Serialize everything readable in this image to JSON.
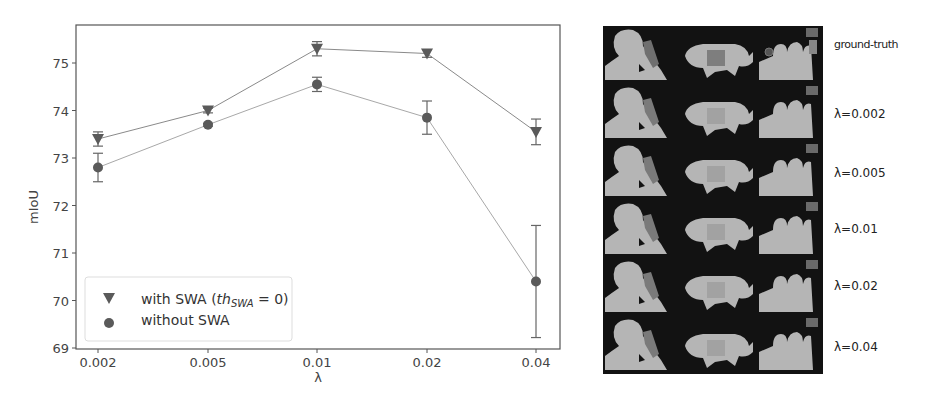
{
  "chart_data": {
    "type": "line",
    "title": "",
    "xlabel": "λ",
    "ylabel": "mIoU",
    "categories": [
      "0.002",
      "0.005",
      "0.01",
      "0.02",
      "0.04"
    ],
    "ylim": [
      69,
      75.8
    ],
    "yticks": [
      69,
      70,
      71,
      72,
      73,
      74,
      75
    ],
    "grid": false,
    "legend_position": "lower left",
    "series": [
      {
        "name": "with SWA (th_SWA = 0)",
        "marker": "triangle-down",
        "color": "#555555",
        "values": [
          73.4,
          74.0,
          75.3,
          75.2,
          73.55
        ],
        "errors": [
          0.15,
          0.05,
          0.15,
          0.08,
          0.27
        ]
      },
      {
        "name": "without SWA",
        "marker": "circle",
        "color": "#555555",
        "values": [
          72.8,
          73.7,
          74.55,
          73.85,
          70.4
        ],
        "errors": [
          0.3,
          0.03,
          0.15,
          0.35,
          1.18
        ]
      }
    ]
  },
  "legend": {
    "items": [
      {
        "prefix": "with SWA (",
        "italic": "th",
        "sub": "SWA",
        "suffix": " = 0)"
      },
      {
        "prefix": "without SWA",
        "italic": "",
        "sub": "",
        "suffix": ""
      }
    ]
  },
  "segmentation_panel": {
    "columns": [
      "person-scene",
      "animal-scene",
      "crowd-scene"
    ],
    "row_labels": [
      "ground-truth",
      "λ=0.002",
      "λ=0.005",
      "λ=0.01",
      "λ=0.02",
      "λ=0.04"
    ]
  },
  "colors": {
    "axis": "#555555",
    "line": "#9a9a9a",
    "marker": "#5a5a5a",
    "panel_bg": "#121212",
    "seg_fg": "#b5b5b5",
    "seg_accent": "#7a7a7a"
  }
}
